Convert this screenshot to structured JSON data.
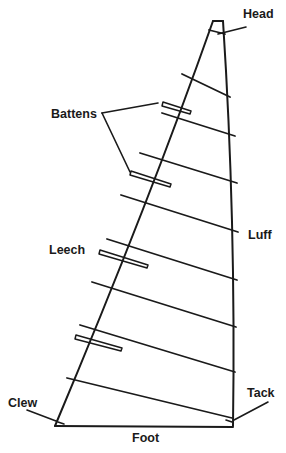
{
  "diagram": {
    "labels": {
      "head": "Head",
      "battens": "Battens",
      "leech": "Leech",
      "luff": "Luff",
      "clew": "Clew",
      "tack": "Tack",
      "foot": "Foot"
    },
    "colors": {
      "line": "#1a1a1a",
      "background": "#ffffff"
    },
    "sail_outline": {
      "head_left": [
        213,
        21
      ],
      "head_right": [
        223,
        21
      ],
      "tack": [
        233,
        426
      ],
      "clew": [
        55,
        426
      ]
    },
    "seams": [
      [
        [
          209,
          30
        ],
        [
          225,
          34
        ]
      ],
      [
        [
          182,
          74
        ],
        [
          230,
          97
        ]
      ],
      [
        [
          162,
          113
        ],
        [
          235,
          136
        ]
      ],
      [
        [
          140,
          153
        ],
        [
          237,
          183
        ]
      ],
      [
        [
          121,
          195
        ],
        [
          238,
          232
        ]
      ],
      [
        [
          107,
          239
        ],
        [
          237,
          280
        ]
      ],
      [
        [
          92,
          282
        ],
        [
          236,
          327
        ]
      ],
      [
        [
          80,
          325
        ],
        [
          235,
          372
        ]
      ],
      [
        [
          67,
          378
        ],
        [
          232,
          418
        ]
      ]
    ],
    "battens": [
      [
        [
          163,
          104
        ],
        [
          190,
          113
        ]
      ],
      [
        [
          131,
          173
        ],
        [
          170,
          186
        ]
      ],
      [
        [
          100,
          252
        ],
        [
          147,
          267
        ]
      ],
      [
        [
          76,
          337
        ],
        [
          121,
          350
        ]
      ]
    ]
  }
}
